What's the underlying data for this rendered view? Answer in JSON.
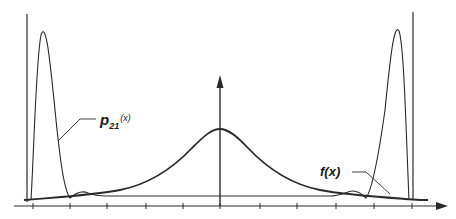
{
  "figure": {
    "labels": {
      "p21": {
        "main": "p",
        "subscript": "21",
        "argument": "(x)"
      },
      "f": {
        "text": "f(x)"
      }
    },
    "colors": {
      "ink": "#2a2a2a",
      "background": "#ffffff"
    },
    "x_axis": {
      "tick_positions_px": [
        33,
        70,
        107,
        146,
        183,
        220,
        260,
        297,
        336,
        374,
        412
      ],
      "arrow": "right"
    },
    "y_axis": {
      "position_px": 220,
      "arrow": "up"
    }
  },
  "chart_data": {
    "type": "line",
    "title": "",
    "xlabel": "",
    "ylabel": "",
    "grid": false,
    "legend": "none (inline callout labels)",
    "series": [
      {
        "name": "f(x)",
        "shape": "bell-shaped, centered at x=0, broad, peak height ~0.55 of p21 peak"
      },
      {
        "name": "p21(x)",
        "shape": "two sharp peaks near both boundary walls with small ripples, near zero in the middle"
      }
    ],
    "annotations": [
      "p21(x)",
      "f(x)",
      "vertical walls at left and right boundaries"
    ]
  }
}
